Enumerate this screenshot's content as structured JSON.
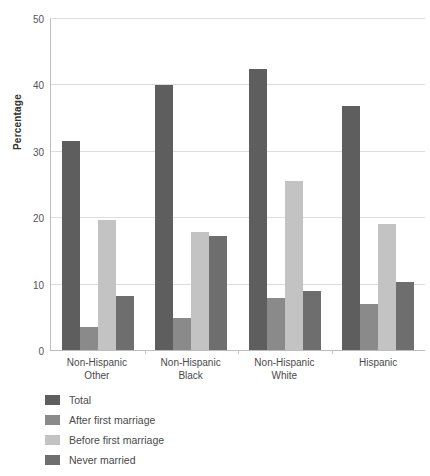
{
  "chart_data": {
    "type": "bar",
    "title": "",
    "xlabel": "",
    "ylabel": "Percentage",
    "ylim": [
      0,
      50
    ],
    "yticks": [
      0,
      10,
      20,
      30,
      40,
      50
    ],
    "ytick_labels": [
      "0",
      "10",
      "20",
      "30",
      "40",
      "50"
    ],
    "grid": true,
    "legend_position": "below-left",
    "categories": [
      "Non-Hispanic Other",
      "Non-Hispanic Black",
      "Non-Hispanic White",
      "Hispanic"
    ],
    "category_lines": [
      [
        "Non-Hispanic",
        "Other"
      ],
      [
        "Non-Hispanic",
        "Black"
      ],
      [
        "Non-Hispanic",
        "White"
      ],
      [
        "Hispanic",
        ""
      ]
    ],
    "series": [
      {
        "name": "Total",
        "color": "#5e5e5e",
        "values": [
          31.5,
          40.1,
          42.5,
          36.8
        ]
      },
      {
        "name": "After first marriage",
        "color": "#8a8a8a",
        "values": [
          3.5,
          4.8,
          7.9,
          7.0
        ]
      },
      {
        "name": "Before first marriage",
        "color": "#c3c3c3",
        "values": [
          19.7,
          17.8,
          25.6,
          19.0
        ]
      },
      {
        "name": "Never married",
        "color": "#6e6e6e",
        "values": [
          8.2,
          17.2,
          8.9,
          10.3
        ]
      }
    ]
  },
  "axis": {
    "y_title": "Percentage"
  },
  "colors": {
    "gridline": "#dcdcdc",
    "axis": "#bdbdbd",
    "text": "#4a4a4a",
    "background": "#ffffff"
  }
}
